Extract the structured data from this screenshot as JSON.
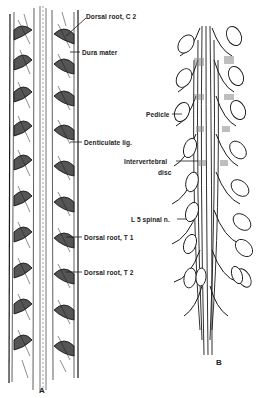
{
  "figure": {
    "panel_a": {
      "letter": "A",
      "labels": [
        {
          "id": "dorsal-root-c2",
          "text": "Dorsal root, C 2"
        },
        {
          "id": "dura-mater",
          "text": "Dura mater"
        },
        {
          "id": "denticulate-lig",
          "text": "Denticulate lig."
        },
        {
          "id": "dorsal-root-t1",
          "text": "Dorsal root, T 1"
        },
        {
          "id": "dorsal-root-t2",
          "text": "Dorsal root, T 2"
        }
      ]
    },
    "panel_b": {
      "letter": "B",
      "labels": [
        {
          "id": "pedicle",
          "text": "Pedicle"
        },
        {
          "id": "intervertebral-disc-1",
          "text": "Intervertebral"
        },
        {
          "id": "intervertebral-disc-2",
          "text": "disc"
        },
        {
          "id": "l5-spinal-n",
          "text": "L 5 spinal n."
        }
      ]
    },
    "colors": {
      "ink": "#1a1a1a",
      "background": "#ffffff",
      "shade": "#8a8a8a"
    }
  }
}
